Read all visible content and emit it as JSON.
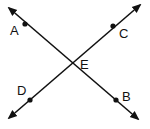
{
  "diagram": {
    "type": "intersecting-lines",
    "lines": [
      {
        "name": "line-AB",
        "from": "A",
        "to": "B",
        "arrows": "both"
      },
      {
        "name": "line-DC",
        "from": "D",
        "to": "C",
        "arrows": "both"
      }
    ],
    "points": [
      {
        "label": "A"
      },
      {
        "label": "B"
      },
      {
        "label": "C"
      },
      {
        "label": "D"
      },
      {
        "label": "E"
      }
    ],
    "stroke_color": "#111111"
  }
}
